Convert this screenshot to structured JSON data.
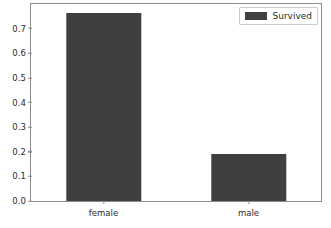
{
  "chart_data": {
    "type": "bar",
    "title": "",
    "xlabel": "",
    "ylabel": "",
    "categories": [
      "female",
      "male"
    ],
    "values": [
      0.7642,
      0.1889
    ],
    "series": [
      {
        "name": "Survived",
        "values": [
          0.7642,
          0.1889
        ],
        "color": "#3f3f3f"
      }
    ],
    "ylim": [
      0.0,
      0.8
    ],
    "yticks": [
      0.0,
      0.1,
      0.2,
      0.3,
      0.4,
      0.5,
      0.6,
      0.7
    ],
    "ytick_labels": [
      "0.0",
      "0.1",
      "0.2",
      "0.3",
      "0.4",
      "0.5",
      "0.6",
      "0.7"
    ],
    "xtick_labels": [
      "female",
      "male"
    ],
    "grid": false,
    "legend": {
      "position": "upper right",
      "entries": [
        {
          "label": "Survived",
          "color": "#3f3f3f"
        }
      ]
    },
    "axes": {
      "frame_color": "#8d8d8d",
      "background": "#ffffff",
      "tick_text_color": "#2b2b2b"
    }
  }
}
